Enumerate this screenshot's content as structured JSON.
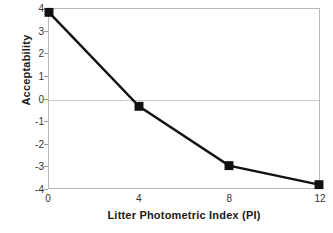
{
  "chart_data": {
    "type": "line",
    "title": "",
    "xlabel": "Litter Photometric Index (PI)",
    "ylabel": "Acceptability",
    "x": [
      0,
      4,
      8,
      12
    ],
    "values": [
      3.85,
      -0.35,
      -3.0,
      -3.85
    ],
    "series": [
      {
        "name": "Acceptability",
        "x": [
          0,
          4,
          8,
          12
        ],
        "values": [
          3.85,
          -0.35,
          -3.0,
          -3.85
        ]
      }
    ],
    "xlim": [
      0,
      12
    ],
    "ylim": [
      -4,
      4
    ],
    "xticks": [
      "0",
      "4",
      "8",
      "12"
    ],
    "yticks": [
      "4",
      "3",
      "2",
      "1",
      "0",
      "-1",
      "-2",
      "-3",
      "-4"
    ],
    "grid": "zero-line-only",
    "legend": "none",
    "marker": "square",
    "colors": {
      "line": "#111111",
      "marker": "#111111",
      "frame": "#b8b8b8",
      "gridline": "#c9c9c9",
      "tick_text": "#333333",
      "axis_title": "#1a1a1a",
      "background": "#ffffff"
    }
  }
}
